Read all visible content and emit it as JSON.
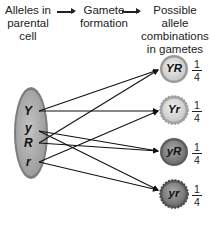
{
  "header": {
    "col1": "Alleles in parental cell",
    "col1_lines": [
      "Alleles in",
      "parental",
      "cell"
    ],
    "col2_lines": [
      "Gamete",
      "formation"
    ],
    "col3_lines": [
      "Possible allele",
      "combinations",
      "in gametes"
    ]
  },
  "parental_cell": {
    "alleles": [
      "Y",
      "y",
      "R",
      "r"
    ]
  },
  "gametes": [
    {
      "label": "YR",
      "fraction_num": "1",
      "fraction_den": "4"
    },
    {
      "label": "Yr",
      "fraction_num": "1",
      "fraction_den": "4"
    },
    {
      "label": "yR",
      "fraction_num": "1",
      "fraction_den": "4"
    },
    {
      "label": "yr",
      "fraction_num": "1",
      "fraction_den": "4"
    }
  ],
  "connections": [
    {
      "from": "Y",
      "to": [
        "YR",
        "Yr"
      ]
    },
    {
      "from": "y",
      "to": [
        "yR",
        "yr"
      ]
    },
    {
      "from": "R",
      "to": [
        "YR",
        "yR"
      ]
    },
    {
      "from": "r",
      "to": [
        "Yr",
        "yr"
      ]
    }
  ],
  "colors": {
    "cell_fill": "#a9a9a9",
    "cell_edge": "#7a7a7a",
    "gamete_light": "#d8d8d8",
    "gamete_dark": "#8c8c8c",
    "line": "#111111"
  }
}
